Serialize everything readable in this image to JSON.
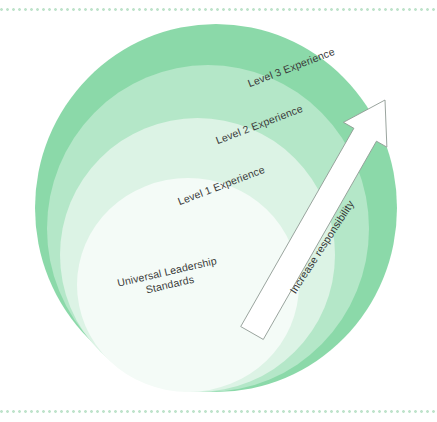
{
  "diagram": {
    "background_color": "#ffffff",
    "rings": [
      {
        "id": "level3",
        "label": "Level 3 Experience",
        "color": "#8bd9a9"
      },
      {
        "id": "level2",
        "label": "Level 2 Experience",
        "color": "#b4e7c8"
      },
      {
        "id": "level1",
        "label": "Level 1 Experience",
        "color": "#dcf3e5"
      },
      {
        "id": "universal",
        "label_line1": "Universal Leadership",
        "label_line2": "Standards",
        "color": "#f4fbf7"
      }
    ],
    "arrow": {
      "label": "Increase responsibility",
      "direction": "up-right",
      "fill_color": "#ffffff",
      "stroke_color": "#8f9a93"
    },
    "rules": {
      "dot_color": "#bfe3cb"
    },
    "text_color": "#3b3b3b"
  }
}
